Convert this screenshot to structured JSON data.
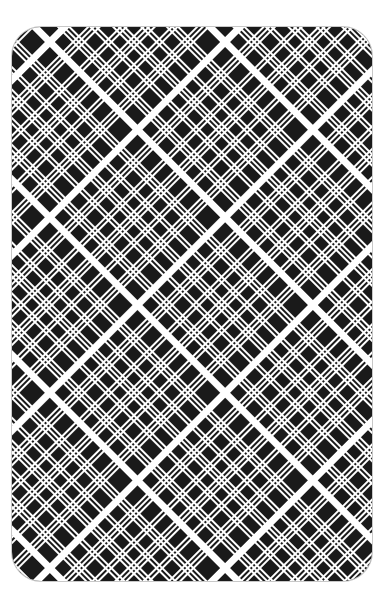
{
  "card": {
    "side": "back",
    "pattern": "diagonal tartan / plaid",
    "colors": {
      "ink": "#1a1a1a",
      "stripe": "#ffffff",
      "border": "#c8c8c8",
      "background": "#ffffff"
    },
    "pattern_period_px": 124,
    "pattern_angle_deg": 45
  }
}
